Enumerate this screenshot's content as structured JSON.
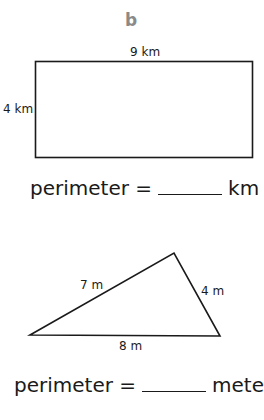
{
  "problem_label": "b",
  "rectangle": {
    "top_label": "9 km",
    "side_label": "4 km",
    "width": 9,
    "height": 4,
    "unit": "km",
    "answer_prefix": "perimeter =",
    "answer_unit": "km"
  },
  "triangle": {
    "left_side_label": "7 m",
    "right_side_label": "4 m",
    "base_label": "8 m",
    "sides": [
      7,
      4,
      8
    ],
    "unit": "m",
    "answer_prefix": "perimeter =",
    "answer_unit": "meters"
  },
  "colors": {
    "ink": "#1a1a1a",
    "label_gray": "#8a8a8a"
  }
}
